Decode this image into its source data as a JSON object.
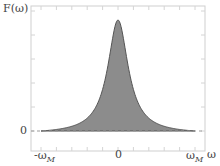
{
  "chart_data": {
    "type": "area",
    "title": "",
    "ylabel": "F(ω)",
    "xlabel": "ω",
    "x_ticks": [
      "-ω_M",
      "0",
      "ω_M"
    ],
    "y_ticks": [
      "0"
    ],
    "xlim": [
      -1.1,
      1.1
    ],
    "ylim": [
      0,
      1.0
    ],
    "grid": false,
    "legend": null,
    "series": [
      {
        "name": "F(ω)",
        "fill": "#8c8c8c",
        "stroke": "#555555",
        "x": [
          -1.0,
          -0.8,
          -0.6,
          -0.4,
          -0.3,
          -0.2,
          -0.1,
          0.0,
          0.1,
          0.2,
          0.3,
          0.4,
          0.6,
          0.8,
          1.0
        ],
        "values": [
          0.0,
          0.07,
          0.15,
          0.27,
          0.37,
          0.55,
          0.82,
          1.0,
          0.82,
          0.55,
          0.37,
          0.27,
          0.15,
          0.07,
          0.0
        ]
      }
    ],
    "annotations": [
      "dashed zero baseline"
    ]
  },
  "labels": {
    "y_axis": "F(ω)",
    "y_zero": "0",
    "x_neg": "-ω",
    "x_neg_sub": "M",
    "x_zero": "0",
    "x_pos": "ω",
    "x_pos_sub": "M",
    "x_axis": "ω"
  }
}
